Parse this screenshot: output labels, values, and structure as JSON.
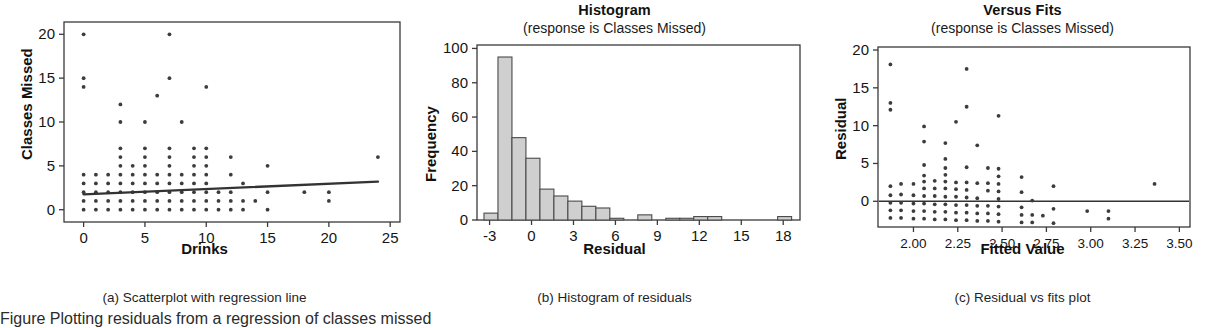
{
  "figure": {
    "background": "#ffffff",
    "ink": "#333333",
    "bar_fill": "#cfcfcf",
    "bottom_caption_fragment": "Figure  Plotting  residuals  from  a  regression  of  classes  missed"
  },
  "panels": [
    {
      "id": "scatterplot",
      "title": "",
      "subtitle": "",
      "caption": "(a) Scatterplot with regression line",
      "xlabel": "Drinks",
      "ylabel": "Classes Missed"
    },
    {
      "id": "histogram",
      "title": "Histogram",
      "subtitle": "(response is Classes Missed)",
      "caption": "(b) Histogram of residuals",
      "xlabel": "Residual",
      "ylabel": "Frequency"
    },
    {
      "id": "versus-fits",
      "title": "Versus Fits",
      "subtitle": "(response is Classes Missed)",
      "caption": "(c) Residual vs fits plot",
      "xlabel": "Fitted Value",
      "ylabel": "Residual"
    }
  ],
  "chart_data": [
    {
      "type": "scatter",
      "id": "scatterplot",
      "title": "",
      "subtitle": "",
      "caption": "(a) Scatterplot with regression line",
      "xlabel": "Drinks",
      "ylabel": "Classes Missed",
      "xlim": [
        -1.6,
        25.8
      ],
      "ylim": [
        -1.4,
        21.4
      ],
      "xticks": [
        0,
        5,
        10,
        15,
        20,
        25
      ],
      "xticklabels": [
        "0",
        "5",
        "10",
        "15",
        "20",
        "25"
      ],
      "yticks": [
        0,
        5,
        10,
        15,
        20
      ],
      "yticklabels": [
        "0",
        "5",
        "10",
        "15",
        "20"
      ],
      "grid": false,
      "legend": null,
      "regression_line": {
        "x": [
          0,
          24
        ],
        "y": [
          1.75,
          3.2
        ],
        "label": "regression line"
      },
      "points": [
        [
          0,
          0
        ],
        [
          0,
          1
        ],
        [
          0,
          2
        ],
        [
          0,
          3
        ],
        [
          0,
          4
        ],
        [
          0,
          14
        ],
        [
          0,
          15
        ],
        [
          0,
          20
        ],
        [
          1,
          0
        ],
        [
          1,
          1
        ],
        [
          1,
          2
        ],
        [
          1,
          3
        ],
        [
          1,
          4
        ],
        [
          2,
          0
        ],
        [
          2,
          1
        ],
        [
          2,
          2
        ],
        [
          2,
          3
        ],
        [
          2,
          4
        ],
        [
          3,
          0
        ],
        [
          3,
          1
        ],
        [
          3,
          2
        ],
        [
          3,
          3
        ],
        [
          3,
          4
        ],
        [
          3,
          5
        ],
        [
          3,
          6
        ],
        [
          3,
          7
        ],
        [
          3,
          10
        ],
        [
          3,
          12
        ],
        [
          4,
          0
        ],
        [
          4,
          1
        ],
        [
          4,
          2
        ],
        [
          4,
          3
        ],
        [
          4,
          4
        ],
        [
          4,
          5
        ],
        [
          5,
          0
        ],
        [
          5,
          1
        ],
        [
          5,
          2
        ],
        [
          5,
          3
        ],
        [
          5,
          4
        ],
        [
          5,
          5
        ],
        [
          5,
          6
        ],
        [
          5,
          7
        ],
        [
          5,
          10
        ],
        [
          6,
          0
        ],
        [
          6,
          1
        ],
        [
          6,
          2
        ],
        [
          6,
          3
        ],
        [
          6,
          4
        ],
        [
          6,
          13
        ],
        [
          7,
          0
        ],
        [
          7,
          1
        ],
        [
          7,
          2
        ],
        [
          7,
          3
        ],
        [
          7,
          4
        ],
        [
          7,
          5
        ],
        [
          7,
          6
        ],
        [
          7,
          7
        ],
        [
          7,
          15
        ],
        [
          7,
          20
        ],
        [
          8,
          0
        ],
        [
          8,
          1
        ],
        [
          8,
          2
        ],
        [
          8,
          3
        ],
        [
          8,
          4
        ],
        [
          8,
          10
        ],
        [
          9,
          0
        ],
        [
          9,
          1
        ],
        [
          9,
          2
        ],
        [
          9,
          3
        ],
        [
          9,
          4
        ],
        [
          9,
          5
        ],
        [
          9,
          6
        ],
        [
          9,
          7
        ],
        [
          10,
          0
        ],
        [
          10,
          1
        ],
        [
          10,
          2
        ],
        [
          10,
          3
        ],
        [
          10,
          4
        ],
        [
          10,
          5
        ],
        [
          10,
          6
        ],
        [
          10,
          7
        ],
        [
          10,
          14
        ],
        [
          11,
          0
        ],
        [
          11,
          1
        ],
        [
          11,
          2
        ],
        [
          12,
          0
        ],
        [
          12,
          1
        ],
        [
          12,
          2
        ],
        [
          12,
          4
        ],
        [
          12,
          6
        ],
        [
          13,
          0
        ],
        [
          13,
          1
        ],
        [
          13,
          3
        ],
        [
          14,
          1
        ],
        [
          15,
          0
        ],
        [
          15,
          2
        ],
        [
          15,
          5
        ],
        [
          18,
          2
        ],
        [
          20,
          1
        ],
        [
          20,
          2
        ],
        [
          24,
          6
        ]
      ]
    },
    {
      "type": "bar",
      "id": "histogram",
      "title": "Histogram",
      "subtitle": "(response is Classes Missed)",
      "caption": "(b) Histogram of residuals",
      "xlabel": "Residual",
      "ylabel": "Frequency",
      "xlim": [
        -3.9,
        19.2
      ],
      "ylim": [
        0,
        102
      ],
      "xticks": [
        -3,
        0,
        3,
        6,
        9,
        12,
        15,
        18
      ],
      "xticklabels": [
        "-3",
        "0",
        "3",
        "6",
        "9",
        "12",
        "15",
        "18"
      ],
      "yticks": [
        0,
        20,
        40,
        60,
        80,
        100
      ],
      "yticklabels": [
        "0",
        "20",
        "40",
        "60",
        "80",
        "100"
      ],
      "grid": false,
      "legend": null,
      "bin_width": 1,
      "bin_left_edges": [
        -3.4,
        -2.4,
        -1.4,
        -0.4,
        0.6,
        1.6,
        2.6,
        3.6,
        4.6,
        5.6,
        7.6,
        9.6,
        10.6,
        11.6,
        12.6,
        17.6
      ],
      "values": [
        4,
        95,
        48,
        36,
        18,
        14,
        11,
        8,
        7,
        1,
        3,
        1,
        1,
        2,
        2,
        2
      ]
    },
    {
      "type": "scatter",
      "id": "versus-fits",
      "title": "Versus Fits",
      "subtitle": "(response is Classes Missed)",
      "caption": "(c) Residual vs fits plot",
      "xlabel": "Fitted Value",
      "ylabel": "Residual",
      "xlim": [
        1.8,
        3.56
      ],
      "ylim": [
        -3.4,
        20.4
      ],
      "xticks": [
        2.0,
        2.25,
        2.5,
        2.75,
        3.0,
        3.25,
        3.5
      ],
      "xticklabels": [
        "2.00",
        "2.25",
        "2.50",
        "2.75",
        "3.00",
        "3.25",
        "3.50"
      ],
      "yticks": [
        0,
        5,
        10,
        15,
        20
      ],
      "yticklabels": [
        "0",
        "5",
        "10",
        "15",
        "20"
      ],
      "grid": false,
      "legend": null,
      "zero_line": 0,
      "points": [
        [
          1.87,
          -2.2
        ],
        [
          1.87,
          -1.2
        ],
        [
          1.87,
          -0.2
        ],
        [
          1.87,
          0.8
        ],
        [
          1.87,
          2.0
        ],
        [
          1.87,
          12.1
        ],
        [
          1.87,
          13.0
        ],
        [
          1.87,
          18.1
        ],
        [
          1.93,
          -2.2
        ],
        [
          1.93,
          -1.2
        ],
        [
          1.93,
          -0.2
        ],
        [
          1.93,
          0.9
        ],
        [
          1.93,
          2.3
        ],
        [
          2.0,
          -2.3
        ],
        [
          2.0,
          -1.3
        ],
        [
          2.0,
          -0.3
        ],
        [
          2.0,
          0.8
        ],
        [
          2.0,
          2.3
        ],
        [
          2.06,
          -2.3
        ],
        [
          2.06,
          -1.3
        ],
        [
          2.06,
          -0.3
        ],
        [
          2.06,
          0.7
        ],
        [
          2.06,
          1.7
        ],
        [
          2.06,
          2.6
        ],
        [
          2.06,
          3.4
        ],
        [
          2.06,
          4.8
        ],
        [
          2.06,
          7.9
        ],
        [
          2.06,
          9.9
        ],
        [
          2.12,
          -2.4
        ],
        [
          2.12,
          -1.4
        ],
        [
          2.12,
          -0.4
        ],
        [
          2.12,
          0.7
        ],
        [
          2.12,
          1.7
        ],
        [
          2.12,
          2.7
        ],
        [
          2.18,
          -2.4
        ],
        [
          2.18,
          -1.4
        ],
        [
          2.18,
          -0.4
        ],
        [
          2.18,
          0.6
        ],
        [
          2.18,
          1.7
        ],
        [
          2.18,
          2.6
        ],
        [
          2.18,
          3.5
        ],
        [
          2.18,
          4.4
        ],
        [
          2.18,
          5.6
        ],
        [
          2.18,
          7.7
        ],
        [
          2.24,
          -2.5
        ],
        [
          2.24,
          -1.5
        ],
        [
          2.24,
          -0.5
        ],
        [
          2.24,
          0.6
        ],
        [
          2.24,
          1.6
        ],
        [
          2.24,
          2.5
        ],
        [
          2.24,
          10.5
        ],
        [
          2.3,
          -2.5
        ],
        [
          2.3,
          -1.5
        ],
        [
          2.3,
          -0.5
        ],
        [
          2.3,
          0.5
        ],
        [
          2.3,
          1.5
        ],
        [
          2.3,
          2.5
        ],
        [
          2.3,
          4.5
        ],
        [
          2.3,
          12.5
        ],
        [
          2.3,
          17.5
        ],
        [
          2.36,
          -2.6
        ],
        [
          2.36,
          -1.6
        ],
        [
          2.36,
          -0.6
        ],
        [
          2.36,
          0.4
        ],
        [
          2.36,
          2.4
        ],
        [
          2.36,
          7.4
        ],
        [
          2.42,
          -2.6
        ],
        [
          2.42,
          -1.6
        ],
        [
          2.42,
          -0.6
        ],
        [
          2.42,
          1.4
        ],
        [
          2.42,
          2.4
        ],
        [
          2.42,
          4.4
        ],
        [
          2.48,
          -2.7
        ],
        [
          2.48,
          -1.7
        ],
        [
          2.48,
          -0.7
        ],
        [
          2.48,
          0.3
        ],
        [
          2.48,
          1.3
        ],
        [
          2.48,
          2.3
        ],
        [
          2.48,
          3.3
        ],
        [
          2.48,
          4.3
        ],
        [
          2.48,
          11.3
        ],
        [
          2.61,
          -2.8
        ],
        [
          2.61,
          -1.8
        ],
        [
          2.61,
          -0.8
        ],
        [
          2.61,
          1.2
        ],
        [
          2.61,
          3.2
        ],
        [
          2.67,
          -2.8
        ],
        [
          2.67,
          -1.8
        ],
        [
          2.67,
          0.1
        ],
        [
          2.73,
          -1.9
        ],
        [
          2.79,
          -2.9
        ],
        [
          2.79,
          -1.0
        ],
        [
          2.79,
          2.0
        ],
        [
          2.98,
          -1.3
        ],
        [
          3.1,
          -2.3
        ],
        [
          3.1,
          -1.3
        ],
        [
          3.36,
          2.3
        ]
      ]
    }
  ]
}
